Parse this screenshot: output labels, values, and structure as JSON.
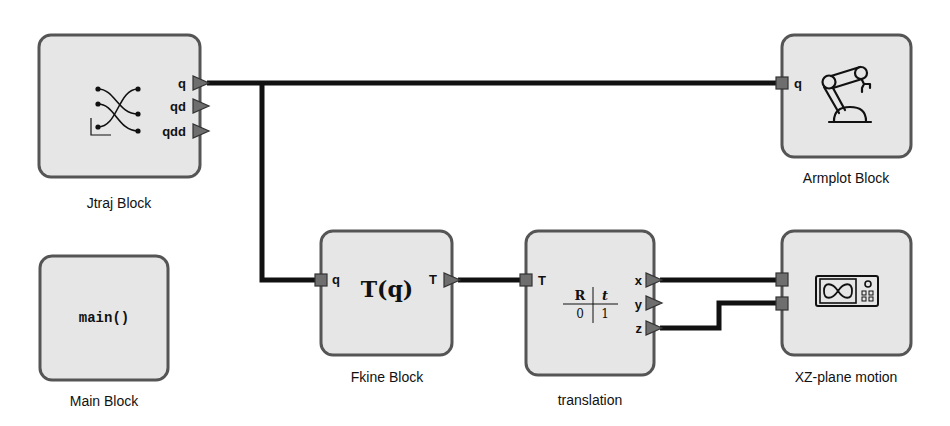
{
  "diagram": {
    "colors": {
      "block_fill": "#e6e6e6",
      "block_stroke": "#555555",
      "wire": "#111111",
      "port": "#6e6e6e",
      "background": "#ffffff"
    },
    "blocks": {
      "jtraj": {
        "label": "Jtraj Block",
        "icon": "trajectory-icon",
        "outputs": [
          "q",
          "qd",
          "qdd"
        ]
      },
      "armplot": {
        "label": "Armplot Block",
        "icon": "robot-arm-icon",
        "inputs": [
          "q"
        ]
      },
      "main": {
        "label": "Main Block",
        "content": "main()"
      },
      "fkine": {
        "label": "Fkine Block",
        "content": "T(q)",
        "inputs": [
          "q"
        ],
        "outputs": [
          "T"
        ]
      },
      "translation": {
        "label": "translation",
        "matrix": {
          "r": "R",
          "t": "t",
          "zero": "0",
          "one": "1"
        },
        "inputs": [
          "T"
        ],
        "outputs": [
          "x",
          "y",
          "z"
        ]
      },
      "xzplot": {
        "label": "XZ-plane motion",
        "icon": "oscilloscope-icon",
        "inputs": [
          "",
          ""
        ]
      }
    },
    "wires": [
      {
        "from": "Jtraj Block.q",
        "to": "Armplot Block.q"
      },
      {
        "from": "Jtraj Block.q",
        "to": "Fkine Block.q"
      },
      {
        "from": "Fkine Block.T",
        "to": "translation.T"
      },
      {
        "from": "translation.x",
        "to": "XZ-plane motion.in1"
      },
      {
        "from": "translation.z",
        "to": "XZ-plane motion.in2"
      }
    ]
  }
}
